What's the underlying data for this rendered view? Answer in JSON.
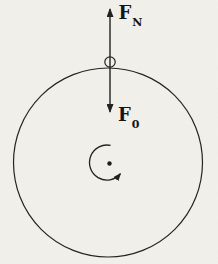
{
  "figure": {
    "type": "rotating-disk-free-body-diagram",
    "background_color": "#f2f1ec",
    "line_color": "#222222",
    "forces": {
      "normal": {
        "symbol": "F",
        "subscript": "N",
        "direction": "up"
      },
      "load": {
        "symbol": "F",
        "subscript": "0",
        "direction": "down"
      }
    },
    "rotation": {
      "direction": "counterclockwise"
    }
  }
}
